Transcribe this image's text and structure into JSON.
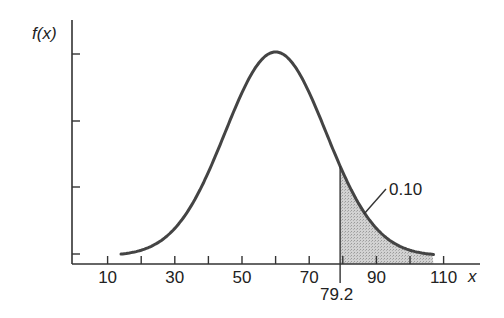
{
  "chart_data": {
    "type": "line",
    "title": "",
    "xlabel": "x",
    "ylabel": "f(x)",
    "distribution": "normal",
    "mean": 60,
    "std": 15,
    "curve_x_range": [
      14,
      107
    ],
    "xlim": [
      0,
      120
    ],
    "x_ticks": [
      10,
      20,
      30,
      40,
      50,
      60,
      70,
      80,
      90,
      100,
      110
    ],
    "x_tick_labels": [
      "10",
      "30",
      "50",
      "70",
      "90",
      "110"
    ],
    "x_tick_label_positions": [
      10,
      30,
      50,
      70,
      90,
      110
    ],
    "y_ticks_count": 4,
    "y_tick_labels": [],
    "grid": false,
    "shaded_region": {
      "from": 79.2,
      "to": 107,
      "area": 0.1,
      "label": "0.10",
      "fill": "#c8c8c8"
    },
    "annotations": [
      {
        "text": "79.2",
        "x": 79.2,
        "note": "cutoff marker below axis"
      },
      {
        "text": "0.10",
        "note": "shaded upper-tail area"
      }
    ],
    "line_color": "#444444"
  },
  "labels": {
    "y_axis": "f(x)",
    "x_axis": "x",
    "cutoff": "79.2",
    "area": "0.10"
  }
}
